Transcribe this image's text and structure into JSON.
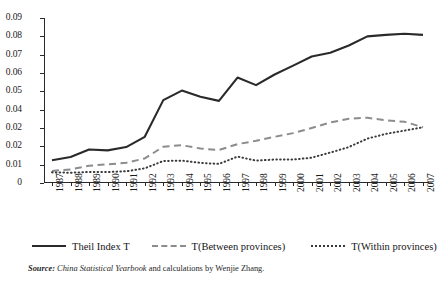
{
  "chart_data": {
    "type": "line",
    "title": "",
    "subtitle": "",
    "xlabel": "",
    "ylabel": "",
    "grid": false,
    "legend_position": "bottom",
    "ylim": [
      0,
      0.09
    ],
    "ytick_values": [
      0.09,
      0.08,
      0.07,
      0.06,
      0.05,
      0.04,
      0.03,
      0.02,
      0.01,
      0
    ],
    "ytick_labels": [
      "0.09",
      "0.08",
      "0.07",
      "0.06",
      "0.05",
      "0.04",
      "0.02",
      "0.02",
      "0.01",
      "0"
    ],
    "categories": [
      "1987",
      "1988",
      "1989",
      "1990",
      "1991",
      "1992",
      "1993",
      "1994",
      "1995",
      "1996",
      "1997",
      "1998",
      "1999",
      "2000",
      "2001",
      "2002",
      "2003",
      "2004",
      "2005",
      "2006",
      "2007"
    ],
    "x": [
      1987,
      1988,
      1989,
      1990,
      1991,
      1992,
      1993,
      1994,
      1995,
      1996,
      1997,
      1998,
      1999,
      2000,
      2001,
      2002,
      2003,
      2004,
      2005,
      2006,
      2007
    ],
    "series": [
      {
        "name": "Theil Index T",
        "style": "solid",
        "color": "#2a2a2a",
        "values": [
          0.0124,
          0.0142,
          0.0183,
          0.0178,
          0.0196,
          0.0252,
          0.0452,
          0.0504,
          0.047,
          0.0448,
          0.0575,
          0.0534,
          0.0592,
          0.064,
          0.069,
          0.071,
          0.075,
          0.08,
          0.0808,
          0.0814,
          0.0808
        ]
      },
      {
        "name": "T(Between provinces)",
        "style": "dashed",
        "color": "#8c8c8c",
        "values": [
          0.0066,
          0.0074,
          0.0094,
          0.0102,
          0.011,
          0.0134,
          0.0198,
          0.0206,
          0.0188,
          0.018,
          0.0212,
          0.023,
          0.0252,
          0.0272,
          0.03,
          0.033,
          0.035,
          0.0356,
          0.0342,
          0.0334,
          0.0304
        ]
      },
      {
        "name": "T(Within provinces)",
        "style": "dotted",
        "color": "#3a3a3a",
        "values": [
          0.0058,
          0.0056,
          0.006,
          0.006,
          0.0064,
          0.008,
          0.012,
          0.0122,
          0.011,
          0.0104,
          0.0144,
          0.0122,
          0.0128,
          0.0128,
          0.0138,
          0.0166,
          0.0196,
          0.0242,
          0.0268,
          0.0286,
          0.0304
        ]
      }
    ]
  },
  "legend": {
    "items": [
      {
        "label": "Theil Index T"
      },
      {
        "label": "T(Between provinces)"
      },
      {
        "label": "T(Within provinces)"
      }
    ]
  },
  "source": {
    "key": "Source:",
    "title": " China Statistical Yearbook",
    "rest": " and calculations by Wenjie  Zhang."
  }
}
